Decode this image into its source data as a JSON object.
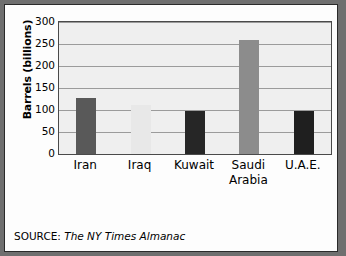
{
  "chart_data": {
    "type": "bar",
    "title": "",
    "subtitle": "",
    "xlabel": "",
    "ylabel": "Barrels (billions)",
    "categories": [
      "Iran",
      "Iraq",
      "Kuwait",
      "Saudi Arabia",
      "U.A.E."
    ],
    "category_lines": [
      [
        "Iran"
      ],
      [
        "Iraq"
      ],
      [
        "Kuwait"
      ],
      [
        "Saudi",
        "Arabia"
      ],
      [
        "U.A.E."
      ]
    ],
    "values": [
      127,
      112,
      98,
      260,
      98
    ],
    "bar_colors": [
      "#595959",
      "#e8e8e8",
      "#262626",
      "#8c8c8c",
      "#1f1f1f"
    ],
    "ylim": [
      0,
      300
    ],
    "yticks": [
      0,
      50,
      100,
      150,
      200,
      250,
      300
    ],
    "ytick_labels": [
      "0",
      "50",
      "100",
      "150",
      "200",
      "250",
      "300"
    ],
    "grid": true,
    "grid_axis": "y",
    "legend": "none",
    "plot_background": "#efefef",
    "gridline_color": "#9b9b9b"
  },
  "source": {
    "label": "SOURCE:",
    "value": "The NY Times Almanac"
  }
}
